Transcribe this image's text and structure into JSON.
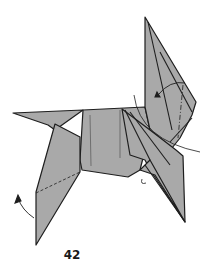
{
  "diagram": {
    "step_number": "42",
    "colors": {
      "paper": "#a9a9a9",
      "outline": "#1e1e1e",
      "background": "#ffffff"
    },
    "annotations": [
      {
        "type": "curved-arrow",
        "description": "rotate/fold arrow near left leg"
      },
      {
        "type": "curved-arrow",
        "description": "fold arrow at top head region"
      },
      {
        "type": "curved-guide",
        "description": "curved movement path on right side"
      },
      {
        "type": "dashed-line",
        "description": "valley fold line on left leg"
      },
      {
        "type": "dash-dot-line",
        "description": "mountain fold line on head"
      }
    ]
  }
}
